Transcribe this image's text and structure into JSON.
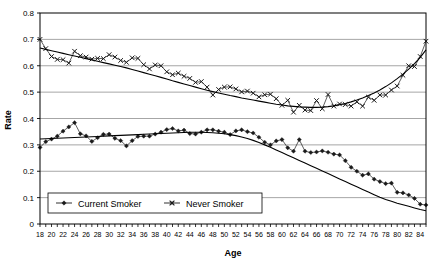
{
  "chart_data": {
    "type": "line",
    "title": "",
    "xlabel": "Age",
    "ylabel": "Rate",
    "xlim": [
      18,
      85
    ],
    "ylim": [
      0,
      0.8
    ],
    "grid": true,
    "legend_position": "bottom-left-inside",
    "y_ticks": [
      "0",
      "0.1",
      "0.2",
      "0.3",
      "0.4",
      "0.5",
      "0.6",
      "0.7",
      "0.8"
    ],
    "y_tick_values": [
      0,
      0.1,
      0.2,
      0.3,
      0.4,
      0.5,
      0.6,
      0.7,
      0.8
    ],
    "x_ticks": [
      "18",
      "20",
      "22",
      "24",
      "26",
      "28",
      "30",
      "32",
      "34",
      "36",
      "38",
      "40",
      "42",
      "44",
      "46",
      "48",
      "50",
      "52",
      "54",
      "56",
      "58",
      "60",
      "62",
      "64",
      "66",
      "68",
      "70",
      "72",
      "74",
      "76",
      "78",
      "80",
      "82",
      "84"
    ],
    "x_tick_values": [
      18,
      20,
      22,
      24,
      26,
      28,
      30,
      32,
      34,
      36,
      38,
      40,
      42,
      44,
      46,
      48,
      50,
      52,
      54,
      56,
      58,
      60,
      62,
      64,
      66,
      68,
      70,
      72,
      74,
      76,
      78,
      80,
      82,
      84
    ],
    "x": [
      18,
      19,
      20,
      21,
      22,
      23,
      24,
      25,
      26,
      27,
      28,
      29,
      30,
      31,
      32,
      33,
      34,
      35,
      36,
      37,
      38,
      39,
      40,
      41,
      42,
      43,
      44,
      45,
      46,
      47,
      48,
      49,
      50,
      51,
      52,
      53,
      54,
      55,
      56,
      57,
      58,
      59,
      60,
      61,
      62,
      63,
      64,
      65,
      66,
      67,
      68,
      69,
      70,
      71,
      72,
      73,
      74,
      75,
      76,
      77,
      78,
      79,
      80,
      81,
      82,
      83,
      84,
      85
    ],
    "series": [
      {
        "name": "Current Smoker",
        "marker": "diamond",
        "color": "#1a1a1a",
        "values": [
          0.29,
          0.312,
          0.322,
          0.333,
          0.352,
          0.368,
          0.384,
          0.342,
          0.334,
          0.313,
          0.327,
          0.34,
          0.341,
          0.325,
          0.316,
          0.296,
          0.316,
          0.332,
          0.333,
          0.333,
          0.341,
          0.348,
          0.358,
          0.362,
          0.353,
          0.356,
          0.343,
          0.341,
          0.348,
          0.357,
          0.357,
          0.352,
          0.348,
          0.339,
          0.353,
          0.357,
          0.35,
          0.345,
          0.329,
          0.31,
          0.3,
          0.315,
          0.32,
          0.289,
          0.276,
          0.32,
          0.276,
          0.271,
          0.273,
          0.277,
          0.272,
          0.265,
          0.262,
          0.24,
          0.215,
          0.2,
          0.185,
          0.19,
          0.17,
          0.161,
          0.153,
          0.155,
          0.12,
          0.118,
          0.11,
          0.097,
          0.075,
          0.072
        ],
        "trend": [
          0.322,
          0.323,
          0.324,
          0.325,
          0.326,
          0.327,
          0.328,
          0.329,
          0.33,
          0.331,
          0.332,
          0.333,
          0.334,
          0.335,
          0.336,
          0.337,
          0.338,
          0.339,
          0.34,
          0.341,
          0.342,
          0.343,
          0.344,
          0.345,
          0.346,
          0.347,
          0.348,
          0.348,
          0.348,
          0.347,
          0.346,
          0.344,
          0.342,
          0.339,
          0.335,
          0.33,
          0.324,
          0.317,
          0.309,
          0.3,
          0.291,
          0.281,
          0.271,
          0.261,
          0.251,
          0.241,
          0.231,
          0.221,
          0.211,
          0.201,
          0.191,
          0.181,
          0.171,
          0.161,
          0.151,
          0.141,
          0.131,
          0.121,
          0.111,
          0.101,
          0.093,
          0.086,
          0.079,
          0.073,
          0.067,
          0.061,
          0.055,
          0.05
        ]
      },
      {
        "name": "Never Smoker",
        "marker": "cross",
        "color": "#1a1a1a",
        "values": [
          0.7,
          0.665,
          0.635,
          0.624,
          0.623,
          0.61,
          0.655,
          0.638,
          0.633,
          0.625,
          0.628,
          0.627,
          0.642,
          0.633,
          0.62,
          0.613,
          0.63,
          0.628,
          0.604,
          0.588,
          0.603,
          0.6,
          0.577,
          0.566,
          0.572,
          0.56,
          0.552,
          0.537,
          0.54,
          0.519,
          0.489,
          0.51,
          0.519,
          0.52,
          0.512,
          0.501,
          0.504,
          0.496,
          0.482,
          0.49,
          0.492,
          0.475,
          0.45,
          0.469,
          0.424,
          0.45,
          0.432,
          0.43,
          0.468,
          0.437,
          0.491,
          0.447,
          0.455,
          0.453,
          0.447,
          0.463,
          0.447,
          0.481,
          0.469,
          0.489,
          0.489,
          0.508,
          0.523,
          0.564,
          0.6,
          0.597,
          0.635,
          0.693
        ],
        "trend": [
          0.667,
          0.662,
          0.657,
          0.652,
          0.647,
          0.642,
          0.637,
          0.632,
          0.627,
          0.622,
          0.617,
          0.612,
          0.607,
          0.602,
          0.597,
          0.592,
          0.586,
          0.58,
          0.574,
          0.568,
          0.562,
          0.556,
          0.55,
          0.543,
          0.537,
          0.531,
          0.525,
          0.519,
          0.513,
          0.507,
          0.502,
          0.497,
          0.492,
          0.487,
          0.483,
          0.478,
          0.474,
          0.47,
          0.466,
          0.462,
          0.458,
          0.454,
          0.451,
          0.448,
          0.446,
          0.444,
          0.443,
          0.442,
          0.442,
          0.443,
          0.445,
          0.448,
          0.452,
          0.457,
          0.463,
          0.47,
          0.478,
          0.487,
          0.497,
          0.508,
          0.521,
          0.535,
          0.551,
          0.568,
          0.587,
          0.608,
          0.632,
          0.66
        ]
      }
    ]
  }
}
